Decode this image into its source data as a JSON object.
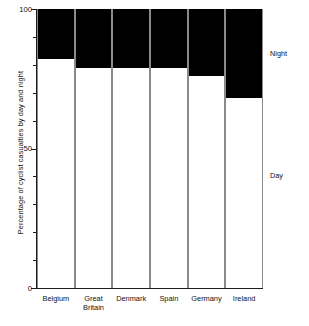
{
  "chart_data": {
    "type": "bar",
    "subtype": "stacked-100-percent",
    "title": "",
    "xlabel": "",
    "ylabel": "Percentage of cyclist casualties by day and night",
    "ylim": [
      0,
      100
    ],
    "y_ticks_major": [
      0,
      50,
      100
    ],
    "y_tick_labels": [
      "0",
      "50",
      "100"
    ],
    "y_ticks_minor": [
      10,
      20,
      30,
      40,
      60,
      70,
      80,
      90
    ],
    "grid": false,
    "legend_position": "right",
    "categories": [
      "Belgium",
      "Great Britain",
      "Denmark",
      "Spain",
      "Germany",
      "Ireland"
    ],
    "series": [
      {
        "name": "Day",
        "color": "#ffffff",
        "values": [
          82,
          79,
          79,
          79,
          76,
          68
        ]
      },
      {
        "name": "Night",
        "color": "#000000",
        "values": [
          18,
          21,
          21,
          21,
          24,
          32
        ]
      }
    ]
  },
  "axis": {
    "y_title": "Percentage of cyclist casualties by day and night",
    "tick_100": "100",
    "tick_50": "50",
    "tick_0": "0"
  },
  "categories": [
    {
      "line1": "Belgium",
      "line2": ""
    },
    {
      "line1": "Great",
      "line2": "Britain"
    },
    {
      "line1": "Denmark",
      "line2": ""
    },
    {
      "line1": "Spain",
      "line2": ""
    },
    {
      "line1": "Germany",
      "line2": ""
    },
    {
      "line1": "Ireland",
      "line2": ""
    }
  ],
  "legend": {
    "night": "Night",
    "day": "Day"
  }
}
